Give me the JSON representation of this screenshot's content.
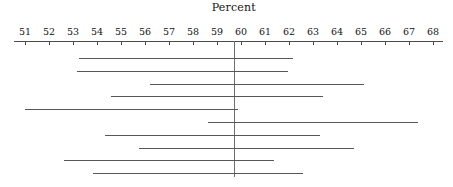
{
  "chart_data": {
    "type": "line",
    "title": "Percent",
    "xlabel": "Percent",
    "ylabel": "",
    "grid": false,
    "legend": null,
    "xlim": [
      50.5,
      68.5
    ],
    "xticks": [
      51,
      52,
      53,
      54,
      55,
      56,
      57,
      58,
      59,
      60,
      61,
      62,
      63,
      64,
      65,
      66,
      67,
      68
    ],
    "xtick_labels": [
      "51",
      "52",
      "53",
      "54",
      "55",
      "56",
      "57",
      "58",
      "59",
      "60",
      "61",
      "62",
      "63",
      "64",
      "65",
      "66",
      "67",
      "68"
    ],
    "reference_line": 59.7,
    "series": [
      {
        "name": "interval-1",
        "low": 53.25,
        "high": 62.17
      },
      {
        "name": "interval-2",
        "low": 53.17,
        "high": 61.96
      },
      {
        "name": "interval-3",
        "low": 56.21,
        "high": 65.13
      },
      {
        "name": "interval-4",
        "low": 54.58,
        "high": 63.42
      },
      {
        "name": "interval-5",
        "low": 51.0,
        "high": 59.88
      },
      {
        "name": "interval-6",
        "low": 58.63,
        "high": 67.38
      },
      {
        "name": "interval-7",
        "low": 54.33,
        "high": 63.29
      },
      {
        "name": "interval-8",
        "low": 55.75,
        "high": 64.71
      },
      {
        "name": "interval-9",
        "low": 52.63,
        "high": 61.38
      },
      {
        "name": "interval-10",
        "low": 53.83,
        "high": 62.58
      }
    ]
  },
  "geometry": {
    "axis_y": 41,
    "axis_left": 14,
    "axis_right": 443,
    "tick_height": 4,
    "tick_label_y": 27,
    "row_start_y": 58,
    "row_spacing": 12.8,
    "ref_line_top": 41,
    "ref_line_bottom": 177,
    "px_per_unit": 24,
    "x_at_51": 25
  },
  "colors": {
    "background": "#ffffff",
    "axis": "#4a4a4a",
    "text": "#141414",
    "interval": "#585858",
    "reference": "#6e6e6e"
  }
}
